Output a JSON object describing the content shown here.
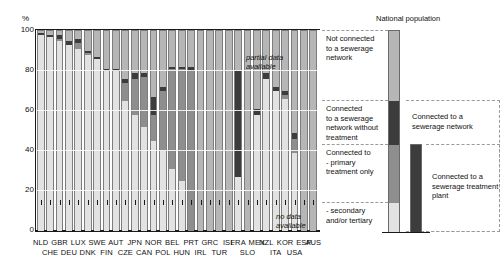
{
  "axis": {
    "unit": "%",
    "yticks": [
      "100",
      "80",
      "60",
      "40",
      "20",
      "0"
    ],
    "ylabel": ""
  },
  "annotations": {
    "partial": "partial data\navailable",
    "partial_line1": "partial data",
    "partial_line2": "available",
    "nodata_line1": "no data",
    "nodata_line2": "available"
  },
  "legend": {
    "title": "National population",
    "items": [
      {
        "key": "not_connected",
        "label": "Not connected\nto a sewerage\nnetwork",
        "lines": [
          "Not connected",
          "to a sewerage",
          "network"
        ],
        "color": "#b6b6b6"
      },
      {
        "key": "no_treatment",
        "label": "Connected\nto a sewerage\nnetwork without\ntreatment",
        "lines": [
          "Connected",
          "to a sewerage",
          "network without",
          "treatment"
        ],
        "color": "#3c3c3c"
      },
      {
        "key": "primary",
        "label": "Connected to\n- primary\ntreatment only",
        "lines": [
          "Connected to",
          "- primary",
          "treatment only"
        ],
        "color": "#8e8e8e"
      },
      {
        "key": "secondary",
        "label": "- secondary\nand/or tertiary",
        "lines": [
          "- secondary",
          "and/or tertiary"
        ],
        "color": "#e2e2e2"
      }
    ],
    "bracket_network": "Connected to a\nsewerage network",
    "bracket_network_l1": "Connected to a",
    "bracket_network_l2": "sewerage network",
    "bracket_plant": "Connected to a\nsewerage treatment\nplant",
    "bracket_plant_l1": "Connected to a",
    "bracket_plant_l2": "sewerage treatment",
    "bracket_plant_l3": "plant"
  },
  "colors": {
    "not_connected": "#b6b6b6",
    "no_treatment": "#3c3c3c",
    "primary": "#8e8e8e",
    "secondary": "#e2e2e2",
    "axis": "#1a1a1a",
    "background": "#ffffff"
  },
  "chart_data": {
    "type": "bar",
    "title": "",
    "subtitle": "",
    "xlabel": "",
    "ylabel": "%",
    "ylim": [
      0,
      100
    ],
    "ytick_values": [
      0,
      20,
      40,
      60,
      80,
      100
    ],
    "grid": true,
    "stacked": true,
    "legend_position": "right",
    "series": [
      {
        "name": "Connected to - secondary and/or tertiary treatment",
        "key": "secondary",
        "color": "#e2e2e2",
        "values": [
          98,
          97,
          95,
          93,
          91,
          88,
          86,
          80,
          80,
          65,
          58,
          52,
          45,
          40,
          31,
          25,
          0,
          0,
          0,
          0,
          0,
          27,
          0,
          58,
          76,
          70,
          66,
          39,
          0
        ]
      },
      {
        "name": "Connected to - primary treatment only",
        "key": "primary",
        "color": "#8e8e8e",
        "values": [
          0,
          0,
          1,
          0,
          3,
          1,
          0,
          0,
          0,
          9,
          18,
          25,
          13,
          30,
          50,
          56,
          80,
          0,
          0,
          0,
          0,
          0,
          0,
          0,
          0,
          0,
          2,
          7,
          0
        ]
      },
      {
        "name": "Connected to a sewerage network without treatment",
        "key": "no_treatment",
        "color": "#3c3c3c",
        "values": [
          1,
          1,
          2,
          2,
          2,
          1,
          1,
          1,
          1,
          2,
          3,
          2,
          9,
          2,
          1,
          1,
          2,
          0,
          0,
          0,
          0,
          53,
          0,
          3,
          3,
          2,
          2,
          3,
          0
        ]
      },
      {
        "name": "Not connected to a sewerage network",
        "key": "not_connected",
        "color": "#b6b6b6",
        "values": [
          1,
          2,
          2,
          5,
          4,
          10,
          13,
          19,
          19,
          24,
          21,
          21,
          33,
          28,
          18,
          18,
          18,
          100,
          100,
          100,
          100,
          20,
          100,
          39,
          21,
          28,
          30,
          51,
          100
        ]
      }
    ],
    "countries": [
      {
        "code": "NLD",
        "row": 1,
        "total_network": 99,
        "secondary": 98,
        "primary": 0,
        "no_treatment": 1,
        "not_connected": 1
      },
      {
        "code": "CHE",
        "row": 2,
        "total_network": 98,
        "secondary": 97,
        "primary": 0,
        "no_treatment": 1,
        "not_connected": 2
      },
      {
        "code": "GBR",
        "row": 1,
        "total_network": 98,
        "secondary": 95,
        "primary": 1,
        "no_treatment": 2,
        "not_connected": 2
      },
      {
        "code": "DEU",
        "row": 2,
        "total_network": 95,
        "secondary": 93,
        "primary": 0,
        "no_treatment": 2,
        "not_connected": 5
      },
      {
        "code": "LUX",
        "row": 1,
        "total_network": 96,
        "secondary": 91,
        "primary": 3,
        "no_treatment": 2,
        "not_connected": 4
      },
      {
        "code": "DNK",
        "row": 2,
        "total_network": 90,
        "secondary": 88,
        "primary": 1,
        "no_treatment": 1,
        "not_connected": 10
      },
      {
        "code": "SWE",
        "row": 1,
        "total_network": 87,
        "secondary": 86,
        "primary": 0,
        "no_treatment": 1,
        "not_connected": 13
      },
      {
        "code": "FIN",
        "row": 2,
        "total_network": 81,
        "secondary": 80,
        "primary": 0,
        "no_treatment": 1,
        "not_connected": 19
      },
      {
        "code": "AUT",
        "row": 1,
        "total_network": 81,
        "secondary": 80,
        "primary": 0,
        "no_treatment": 1,
        "not_connected": 19
      },
      {
        "code": "CZE",
        "row": 2,
        "total_network": 76,
        "secondary": 65,
        "primary": 9,
        "no_treatment": 2,
        "not_connected": 24
      },
      {
        "code": "JPN",
        "row": 1,
        "total_network": 79,
        "secondary": 58,
        "primary": 18,
        "no_treatment": 3,
        "not_connected": 21
      },
      {
        "code": "CAN",
        "row": 2,
        "total_network": 79,
        "secondary": 52,
        "primary": 25,
        "no_treatment": 2,
        "not_connected": 21
      },
      {
        "code": "NOR",
        "row": 1,
        "total_network": 67,
        "secondary": 45,
        "primary": 13,
        "no_treatment": 9,
        "not_connected": 33
      },
      {
        "code": "POL",
        "row": 2,
        "total_network": 72,
        "secondary": 40,
        "primary": 30,
        "no_treatment": 2,
        "not_connected": 28
      },
      {
        "code": "BEL",
        "row": 1,
        "total_network": 82,
        "secondary": 31,
        "primary": 50,
        "no_treatment": 1,
        "not_connected": 18
      },
      {
        "code": "HUN",
        "row": 2,
        "total_network": 82,
        "secondary": 25,
        "primary": 56,
        "no_treatment": 1,
        "not_connected": 18
      },
      {
        "code": "PRT",
        "row": 1,
        "total_network": 82,
        "secondary": 0,
        "primary": 80,
        "no_treatment": 2,
        "not_connected": 18
      },
      {
        "code": "IRL",
        "row": 2,
        "total_network": 0,
        "secondary": 0,
        "primary": 0,
        "no_treatment": 0,
        "not_connected": 100,
        "note": "partial data available"
      },
      {
        "code": "GRC",
        "row": 1,
        "total_network": 0,
        "secondary": 0,
        "primary": 0,
        "no_treatment": 0,
        "not_connected": 100,
        "note": "partial data available"
      },
      {
        "code": "TUR",
        "row": 2,
        "total_network": 0,
        "secondary": 0,
        "primary": 0,
        "no_treatment": 0,
        "not_connected": 100,
        "note": "partial data available"
      },
      {
        "code": "ISL",
        "row": 1,
        "total_network": 0,
        "secondary": 0,
        "primary": 0,
        "no_treatment": 0,
        "not_connected": 100,
        "note": "partial data available"
      },
      {
        "code": "FRA",
        "row": 1,
        "total_network": 80,
        "secondary": 27,
        "primary": 0,
        "no_treatment": 53,
        "not_connected": 20
      },
      {
        "code": "SLO",
        "row": 2,
        "total_network": 0,
        "secondary": 0,
        "primary": 0,
        "no_treatment": 0,
        "not_connected": 100,
        "note": "no data available"
      },
      {
        "code": "MEX",
        "row": 1,
        "total_network": 61,
        "secondary": 58,
        "primary": 0,
        "no_treatment": 3,
        "not_connected": 39
      },
      {
        "code": "NZL",
        "row": 1,
        "total_network": 79,
        "secondary": 76,
        "primary": 0,
        "no_treatment": 3,
        "not_connected": 21
      },
      {
        "code": "ITA",
        "row": 2,
        "total_network": 72,
        "secondary": 70,
        "primary": 0,
        "no_treatment": 2,
        "not_connected": 28
      },
      {
        "code": "KOR",
        "row": 1,
        "total_network": 70,
        "secondary": 66,
        "primary": 2,
        "no_treatment": 2,
        "not_connected": 30
      },
      {
        "code": "USA",
        "row": 2,
        "total_network": 49,
        "secondary": 39,
        "primary": 7,
        "no_treatment": 3,
        "not_connected": 51
      },
      {
        "code": "ESP",
        "row": 1,
        "total_network": 0,
        "secondary": 0,
        "primary": 0,
        "no_treatment": 0,
        "not_connected": 100,
        "note": "no data available"
      },
      {
        "code": "AUS",
        "row": 1,
        "total_network": 0,
        "secondary": 0,
        "primary": 0,
        "no_treatment": 0,
        "not_connected": 100,
        "note": "no data available"
      }
    ],
    "xlabels_row1": [
      "NLD",
      "GBR",
      "LUX",
      "SWE",
      "AUT",
      "JPN",
      "NOR",
      "BEL",
      "PRT",
      "GRC",
      "ISL",
      "FRA",
      "MEX",
      "NZL",
      "KOR",
      "ESP",
      "AUS"
    ],
    "xlabels_row2": [
      "CHE",
      "DEU",
      "DNK",
      "FIN",
      "CZE",
      "CAN",
      "POL",
      "HUN",
      "IRL",
      "TUR",
      "SLO",
      "ITA",
      "USA"
    ]
  }
}
